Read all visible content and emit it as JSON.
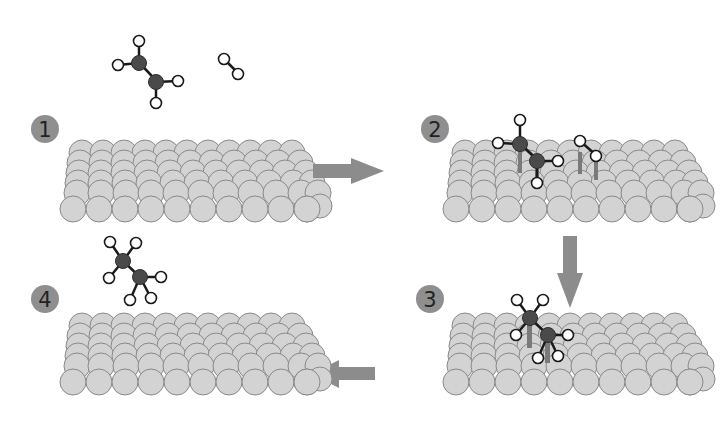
{
  "diagram": {
    "colors": {
      "background": "#ffffff",
      "surface_atom_fill": "#d3d3d3",
      "surface_atom_stroke": "#8a8a8a",
      "carbon_fill": "#4a4a4a",
      "hydrogen_fill": "#ffffff",
      "bond_stroke": "#1a1a1a",
      "surface_bond": "#7a7a7a",
      "arrow_fill": "#8c8c8c",
      "badge_fill": "#8f8f8f",
      "badge_text": "#222222"
    },
    "steps": [
      {
        "number": "1",
        "label": "Ethylene (C2H4) and hydrogen (H2) approach the metal surface",
        "badge": {
          "x": 45,
          "y": 129
        },
        "surface": {
          "x": 60,
          "y": 145
        }
      },
      {
        "number": "2",
        "label": "Ethylene and hydrogen adsorb onto the surface",
        "badge": {
          "x": 435,
          "y": 129
        },
        "surface": {
          "x": 443,
          "y": 145
        }
      },
      {
        "number": "3",
        "label": "Hydrogen atoms add to the carbon atoms",
        "badge": {
          "x": 430,
          "y": 299
        },
        "surface": {
          "x": 443,
          "y": 318
        }
      },
      {
        "number": "4",
        "label": "Ethane (C2H6) desorbs from the surface",
        "badge": {
          "x": 45,
          "y": 299
        },
        "surface": {
          "x": 60,
          "y": 318
        }
      }
    ],
    "arrows": [
      {
        "from": "1",
        "to": "2",
        "direction": "right"
      },
      {
        "from": "2",
        "to": "3",
        "direction": "down"
      },
      {
        "from": "3",
        "to": "4",
        "direction": "left"
      }
    ],
    "molecules": [
      {
        "name": "ethylene",
        "formula": "C2H4",
        "step": "1"
      },
      {
        "name": "hydrogen",
        "formula": "H2",
        "step": "1"
      },
      {
        "name": "ethylene-adsorbed",
        "formula": "C2H4",
        "step": "2"
      },
      {
        "name": "hydrogen-adsorbed",
        "formula": "H2",
        "step": "2"
      },
      {
        "name": "ethane-adsorbed",
        "formula": "C2H6",
        "step": "3"
      },
      {
        "name": "ethane",
        "formula": "C2H6",
        "step": "4"
      }
    ]
  }
}
